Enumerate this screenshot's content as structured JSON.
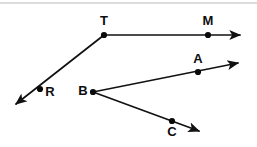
{
  "diagram": {
    "background_color": "#ffffff",
    "stroke_color": "#111111",
    "label_color": "#0d0d0d",
    "divider_color": "#b9b9bb",
    "width": 257,
    "height": 147,
    "points": [
      {
        "name": "T",
        "label": "T",
        "x": 104,
        "y": 35,
        "label_x": 104,
        "label_y": 22,
        "role": "vertex"
      },
      {
        "name": "M",
        "label": "M",
        "x": 208,
        "y": 35,
        "label_x": 208,
        "label_y": 22,
        "role": "point-on-ray"
      },
      {
        "name": "R",
        "label": "R",
        "x": 40,
        "y": 89,
        "label_x": 50,
        "label_y": 93,
        "role": "point-on-ray"
      },
      {
        "name": "B",
        "label": "B",
        "x": 93,
        "y": 92,
        "label_x": 83,
        "label_y": 92,
        "role": "vertex"
      },
      {
        "name": "A",
        "label": "A",
        "x": 198,
        "y": 72,
        "label_x": 198,
        "label_y": 60,
        "role": "point-on-ray"
      },
      {
        "name": "C",
        "label": "C",
        "x": 172,
        "y": 121,
        "label_x": 172,
        "label_y": 133,
        "role": "point-on-ray"
      }
    ],
    "rays": [
      {
        "name": "ray-T-to-M",
        "from": "T",
        "through": "M",
        "x1": 104,
        "y1": 35,
        "x2": 246,
        "y2": 35,
        "arrow_at_end": true
      },
      {
        "name": "ray-T-through-R",
        "from": "T",
        "through": "R",
        "x1": 104,
        "y1": 35,
        "x2": 11,
        "y2": 109,
        "arrow_at_end": true
      },
      {
        "name": "ray-B-through-A",
        "from": "B",
        "through": "A",
        "x1": 93,
        "y1": 92,
        "x2": 244,
        "y2": 62,
        "arrow_at_end": true
      },
      {
        "name": "ray-B-through-C",
        "from": "B",
        "through": "C",
        "x1": 93,
        "y1": 92,
        "x2": 205,
        "y2": 134,
        "arrow_at_end": true
      }
    ],
    "divider": {
      "name": "top-divider",
      "x1": 0,
      "y1": 3,
      "x2": 257,
      "y2": 3
    }
  }
}
